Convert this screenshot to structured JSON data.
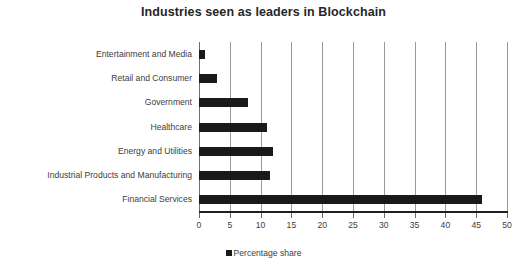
{
  "chart_data": {
    "type": "bar",
    "orientation": "horizontal",
    "title": "Industries seen as leaders in Blockchain",
    "xlabel": "",
    "ylabel": "",
    "xlim": [
      0,
      50
    ],
    "xticks": [
      0,
      5,
      10,
      15,
      20,
      25,
      30,
      35,
      40,
      45,
      50
    ],
    "xtick_labels": [
      "0",
      "5",
      "10",
      "15",
      "20",
      "25",
      "30",
      "35",
      "40",
      "45",
      "50"
    ],
    "grid": "vertical",
    "legend_position": "bottom-center",
    "categories": [
      "Entertainment and Media",
      "Retail and Consumer",
      "Government",
      "Healthcare",
      "Energy and Utilities",
      "Industrial Products and Manufacturing",
      "Financial Services"
    ],
    "series": [
      {
        "name": "Percentage share",
        "color": "#1a1a1a",
        "values": [
          1,
          3,
          8,
          11,
          12,
          11.5,
          46
        ]
      }
    ],
    "values": [
      1,
      3,
      8,
      11,
      12,
      11.5,
      46
    ]
  },
  "legend": {
    "entries": [
      {
        "label": "Percentage share",
        "marker": "square-marker",
        "color": "#1a1a1a"
      }
    ]
  },
  "colors": {
    "bar": "#1a1a1a",
    "gridline": "#9a9a9a",
    "axis": "#1f1f1f",
    "text": "#3d3d3d",
    "title": "#262626",
    "background": "#ffffff"
  }
}
